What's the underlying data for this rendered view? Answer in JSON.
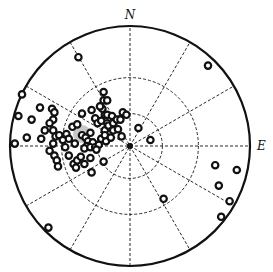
{
  "chart_data": {
    "type": "scatter",
    "projection": "polar-stereonet",
    "title": "",
    "direction_labels": {
      "north": "N",
      "east": "E"
    },
    "rings": [
      0.27,
      0.57,
      1.0
    ],
    "spoke_interval_deg": 30,
    "grid": true,
    "marker": "open-circle",
    "colors": {
      "ink": "#111111",
      "highlight": "#9a9a9a",
      "background": "#ffffff"
    },
    "points_xy_note": "x = east (+), y = north (+), normalized to primitive-circle radius = 1",
    "points": [
      [
        0.65,
        0.67
      ],
      [
        -0.43,
        0.74
      ],
      [
        -0.93,
        0.25
      ],
      [
        -0.96,
        0.02
      ],
      [
        -0.9,
        0.43
      ],
      [
        -0.75,
        0.32
      ],
      [
        -0.65,
        0.31
      ],
      [
        -0.63,
        0.28
      ],
      [
        -0.64,
        0.22
      ],
      [
        -0.67,
        0.19
      ],
      [
        -0.82,
        0.22
      ],
      [
        -0.71,
        0.13
      ],
      [
        -0.64,
        0.13
      ],
      [
        -0.86,
        0.07
      ],
      [
        -0.74,
        0.06
      ],
      [
        -0.62,
        0.08
      ],
      [
        -0.64,
        0.02
      ],
      [
        -0.59,
        0.09
      ],
      [
        -0.53,
        0.1
      ],
      [
        -0.51,
        0.06
      ],
      [
        -0.67,
        -0.04
      ],
      [
        -0.63,
        -0.08
      ],
      [
        -0.61,
        -0.12
      ],
      [
        -0.6,
        -0.17
      ],
      [
        -0.54,
        -0.01
      ],
      [
        -0.56,
        0.05
      ],
      [
        -0.48,
        0.16
      ],
      [
        -0.46,
        0.02
      ],
      [
        -0.44,
        0.18
      ],
      [
        -0.4,
        0.27
      ],
      [
        -0.4,
        0.09
      ],
      [
        -0.37,
        0.07
      ],
      [
        -0.35,
        0.04
      ],
      [
        -0.33,
        0.11
      ],
      [
        -0.31,
        0.03
      ],
      [
        -0.36,
        0.0
      ],
      [
        -0.38,
        -0.02
      ],
      [
        -0.33,
        -0.01
      ],
      [
        -0.29,
        -0.01
      ],
      [
        -0.26,
        0.01
      ],
      [
        -0.24,
        0.06
      ],
      [
        -0.2,
        0.04
      ],
      [
        -0.32,
        0.3
      ],
      [
        -0.29,
        0.23
      ],
      [
        -0.27,
        0.19
      ],
      [
        -0.24,
        0.21
      ],
      [
        -0.21,
        0.26
      ],
      [
        -0.23,
        0.31
      ],
      [
        -0.19,
        0.26
      ],
      [
        -0.15,
        0.25
      ],
      [
        -0.19,
        0.19
      ],
      [
        -0.21,
        0.13
      ],
      [
        -0.18,
        0.17
      ],
      [
        -0.14,
        0.19
      ],
      [
        -0.11,
        0.22
      ],
      [
        -0.14,
        0.13
      ],
      [
        -0.21,
        0.09
      ],
      [
        -0.16,
        0.07
      ],
      [
        -0.1,
        0.14
      ],
      [
        -0.08,
        0.22
      ],
      [
        -0.22,
        0.38
      ],
      [
        -0.22,
        0.45
      ],
      [
        -0.19,
        0.38
      ],
      [
        -0.25,
        0.33
      ],
      [
        -0.06,
        0.28
      ],
      [
        -0.03,
        0.26
      ],
      [
        -0.51,
        -0.08
      ],
      [
        -0.47,
        -0.15
      ],
      [
        -0.44,
        -0.12
      ],
      [
        -0.41,
        -0.09
      ],
      [
        -0.45,
        -0.18
      ],
      [
        -0.38,
        -0.15
      ],
      [
        -0.33,
        -0.1
      ],
      [
        -0.28,
        -0.03
      ],
      [
        -0.32,
        -0.22
      ],
      [
        -0.22,
        -0.13
      ],
      [
        -0.07,
        0.08
      ],
      [
        0.07,
        0.15
      ],
      [
        0.17,
        0.05
      ],
      [
        0.28,
        -0.44
      ],
      [
        -0.68,
        -0.68
      ],
      [
        0.71,
        -0.16
      ],
      [
        0.89,
        -0.2
      ],
      [
        0.74,
        -0.33
      ],
      [
        0.83,
        -0.46
      ],
      [
        0.76,
        -0.59
      ]
    ],
    "highlight_point": [
      -0.4,
      0.1
    ]
  }
}
